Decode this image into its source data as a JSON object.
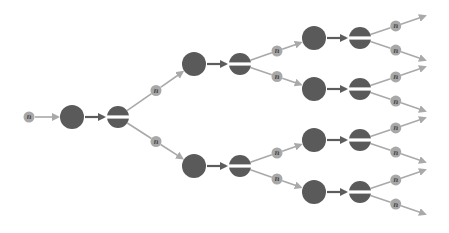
{
  "diagram": {
    "title": "",
    "label_symbol": "n",
    "colors": {
      "cell": "#5a5a5a",
      "label_bubble": "#a8a8a8",
      "label_text": "#4a4a4a",
      "edge_light": "#a9a9a9",
      "edge_dark": "#5c5c5c",
      "split_gap": "#ffffff",
      "background": "#ffffff"
    },
    "generations": [
      {
        "level": 0,
        "cells": 1
      },
      {
        "level": 1,
        "cells": 2
      },
      {
        "level": 2,
        "cells": 4
      },
      {
        "level": 3,
        "outputs": 8
      }
    ]
  }
}
